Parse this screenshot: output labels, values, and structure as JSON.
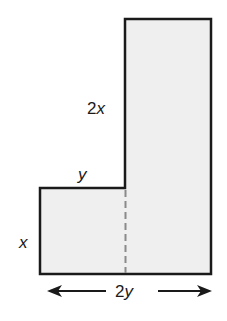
{
  "diagram": {
    "type": "composite-rectangle-L-shape",
    "fill_color": "#efefef",
    "stroke_color": "#1a1a1a",
    "divider_color": "#8a8a8a",
    "labels": {
      "tall_height_coef": "2",
      "tall_height_var": "x",
      "step_width_var": "y",
      "short_height_var": "x",
      "total_width_coef": "2",
      "total_width_var": "y"
    }
  }
}
